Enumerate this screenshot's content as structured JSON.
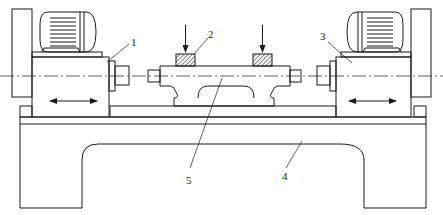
{
  "diagram": {
    "type": "mechanical-schematic",
    "colors": {
      "line": "#1a1a1a",
      "background": "#ffffff",
      "hatch": "#333333"
    },
    "callouts": [
      {
        "id": "1",
        "label": "1",
        "target": "left-head"
      },
      {
        "id": "2",
        "label": "2",
        "target": "clamp-block"
      },
      {
        "id": "3",
        "label": "3",
        "target": "right-head"
      },
      {
        "id": "4",
        "label": "4",
        "target": "bed"
      },
      {
        "id": "5",
        "label": "5",
        "target": "workpiece-fixture"
      }
    ],
    "components": [
      {
        "name": "left-motor"
      },
      {
        "name": "left-head",
        "motion": "bidirectional-horizontal"
      },
      {
        "name": "right-motor"
      },
      {
        "name": "right-head",
        "motion": "bidirectional-horizontal"
      },
      {
        "name": "clamp-block-left",
        "force": "downward-arrow"
      },
      {
        "name": "clamp-block-right",
        "force": "downward-arrow"
      },
      {
        "name": "workpiece-fixture"
      },
      {
        "name": "bed"
      }
    ]
  }
}
